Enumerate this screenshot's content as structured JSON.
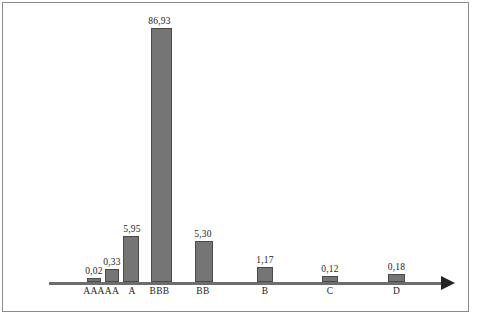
{
  "chart_data": {
    "type": "bar",
    "title": "",
    "subtitle": "",
    "xlabel": "",
    "ylabel": "",
    "categories": [
      "AAA",
      "AA",
      "A",
      "BBB",
      "BB",
      "B",
      "C",
      "D"
    ],
    "values": [
      0.02,
      0.33,
      5.95,
      86.93,
      5.3,
      1.17,
      0.12,
      0.18
    ],
    "value_labels": [
      "0,02",
      "0,33",
      "5,95",
      "86,93",
      "5,30",
      "1,17",
      "0,12",
      "0,18"
    ],
    "decimal_separator": ",",
    "ylim": [
      0,
      86.93
    ],
    "grid": false,
    "legend": null,
    "axis": {
      "x_axis_visible": true,
      "x_axis_arrow": true,
      "y_axis_visible": false,
      "tick_labels": [
        "AAA",
        "AA",
        "A",
        "BBB",
        "BB",
        "B",
        "C",
        "D"
      ]
    },
    "annotations": []
  },
  "style": {
    "bar_fill": "#757575",
    "bar_stroke": "#4a4a4a",
    "axis_color": "#6d6d6d",
    "arrow_color": "#232323",
    "frame_color": "#8a8a8a",
    "background": "#ffffff",
    "label_color": "#1d1d1d"
  },
  "bars": [
    {
      "label": "AAA",
      "value_label": "0,02",
      "x": 87,
      "width": 14,
      "height": 4,
      "label_x": 79,
      "value_x": 79
    },
    {
      "label": "AA",
      "value_label": "0,33",
      "x": 105,
      "width": 14,
      "height": 13,
      "label_x": 97,
      "value_x": 97
    },
    {
      "label": "A",
      "value_label": "5,95",
      "x": 123,
      "width": 16,
      "height": 46,
      "label_x": 116,
      "value_x": 116
    },
    {
      "label": "BBB",
      "value_label": "86,93",
      "x": 151,
      "width": 21,
      "height": 254,
      "label_x": 141,
      "value_x": 141
    },
    {
      "label": "BB",
      "value_label": "5,30",
      "x": 195,
      "width": 18,
      "height": 41,
      "label_x": 186,
      "value_x": 186
    },
    {
      "label": "B",
      "value_label": "1,17",
      "x": 257,
      "width": 16,
      "height": 15,
      "label_x": 249,
      "value_x": 249
    },
    {
      "label": "C",
      "value_label": "0,12",
      "x": 322,
      "width": 16,
      "height": 6,
      "label_x": 314,
      "value_x": 314
    },
    {
      "label": "D",
      "value_label": "0,18",
      "x": 388,
      "width": 17,
      "height": 8,
      "label_x": 380,
      "value_x": 380
    }
  ],
  "geometry": {
    "baseline_y": 282,
    "label_y": 286,
    "value_gap": 12
  }
}
